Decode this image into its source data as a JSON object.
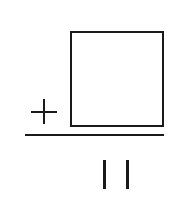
{
  "problem": {
    "operator": "+",
    "answer_box": "",
    "result": "11"
  },
  "colors": {
    "ink": "#1a1a1a",
    "background": "#ffffff"
  }
}
